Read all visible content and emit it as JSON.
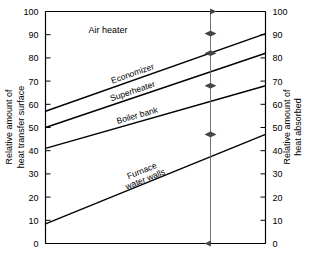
{
  "chart_data": {
    "type": "line",
    "title": "",
    "subtitle": "",
    "xlabel": "",
    "ylabel": "Relative amount of heat transfer surface",
    "y2label": "Relative amount of heat absorbed",
    "ylim": [
      0,
      100
    ],
    "y2lim": [
      0,
      100
    ],
    "xlim": [
      0,
      100
    ],
    "grid": false,
    "legend_position": "inline-labels",
    "y_ticks": [
      0,
      10,
      20,
      30,
      40,
      50,
      60,
      70,
      80,
      90,
      100
    ],
    "y2_ticks": [
      0,
      10,
      20,
      30,
      40,
      50,
      60,
      70,
      80,
      90,
      100
    ],
    "y_tick_labels": [
      "0",
      "10",
      "20",
      "30",
      "40",
      "50",
      "60",
      "70",
      "80",
      "90",
      "100"
    ],
    "y2_tick_labels": [
      "0",
      "10",
      "20",
      "30",
      "40",
      "50",
      "60",
      "70",
      "80",
      "90",
      "100"
    ],
    "x_ticks": [],
    "x_tick_labels": [],
    "series": [
      {
        "name": "Economizer",
        "label": "Economizer",
        "x": [
          0,
          100
        ],
        "values": [
          57,
          90.5
        ]
      },
      {
        "name": "Superheater",
        "label": "Superheater",
        "x": [
          0,
          100
        ],
        "values": [
          50,
          82
        ]
      },
      {
        "name": "Boiler bank",
        "label": "Boiler bank",
        "x": [
          0,
          100
        ],
        "values": [
          41,
          68
        ]
      },
      {
        "name": "Furnace water walls",
        "label": "Furnace water walls",
        "label_line1": "Furnace",
        "label_line2": "water walls",
        "x": [
          0,
          100
        ],
        "values": [
          8.5,
          47
        ]
      }
    ],
    "annotations": [
      {
        "name": "air-heater-region",
        "text": "Air heater",
        "x": 40,
        "y": 93
      }
    ],
    "band_arrow": {
      "name": "band-extent-arrow",
      "x": 75,
      "segments": [
        {
          "from": 100,
          "to": 90.5
        },
        {
          "from": 90.5,
          "to": 82
        },
        {
          "from": 82,
          "to": 68
        },
        {
          "from": 68,
          "to": 47
        },
        {
          "from": 47,
          "to": 0
        }
      ]
    },
    "colors": {
      "axis": "#000000",
      "line": "#000000",
      "arrow": "#555555",
      "background": "#ffffff"
    }
  }
}
